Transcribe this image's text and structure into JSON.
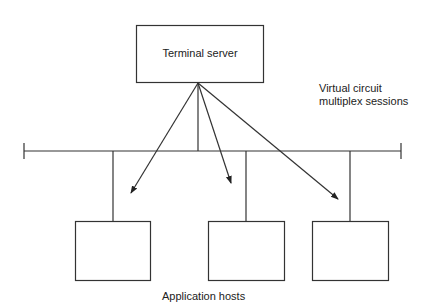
{
  "terminal_server": {
    "label": "Terminal server"
  },
  "annotation": {
    "line1": "Virtual circuit",
    "line2": "multiplex sessions"
  },
  "hosts": {
    "label": "Application hosts",
    "count": 3
  },
  "colors": {
    "stroke": "#333333",
    "background": "#ffffff"
  }
}
